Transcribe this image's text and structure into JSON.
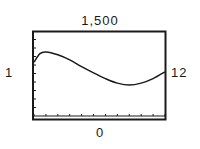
{
  "window": {
    "ymax_label": "1,500",
    "ymin_label": "0",
    "xmin_label": "1",
    "xmax_label": "12"
  },
  "chart_data": {
    "type": "line",
    "title": "",
    "xlabel": "",
    "ylabel": "",
    "xlim": [
      1,
      12
    ],
    "ylim": [
      0,
      1500
    ],
    "x_tick_step": 1,
    "y_tick_step": 150,
    "grid": false,
    "legend": null,
    "series": [
      {
        "name": "curve",
        "x": [
          1,
          1.5,
          2,
          3,
          4,
          5,
          6,
          7,
          8,
          9,
          10,
          11,
          12
        ],
        "y": [
          950,
          1100,
          1130,
          1080,
          990,
          870,
          760,
          660,
          580,
          545,
          580,
          660,
          780
        ]
      }
    ],
    "annotations": [
      "1,500 (Ymax, top)",
      "0 (Ymin, bottom)",
      "1 (Xmin, left)",
      "12 (Xmax, right)"
    ]
  },
  "colors": {
    "line": "#1a1a1a",
    "frame": "#1a1a1a",
    "background": "#ffffff"
  }
}
